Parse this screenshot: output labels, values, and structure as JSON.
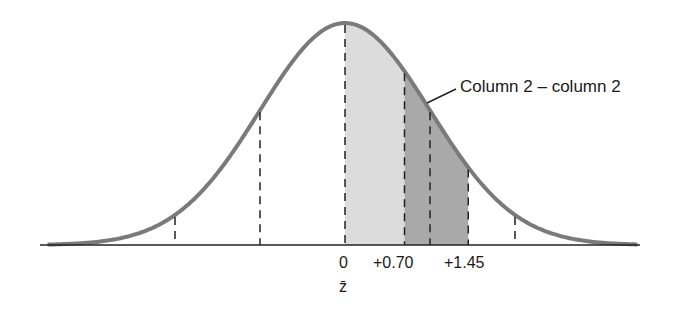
{
  "diagram": {
    "type": "normal-distribution-curve",
    "callout_label": "Column 2 – column 2",
    "axis_labels": {
      "zero": "0",
      "z_bar": "z̄",
      "plus_070": "+0.70",
      "plus_145": "+1.45"
    },
    "shaded_regions": [
      {
        "from": 0,
        "to": 0.7,
        "color": "#dcdcdc"
      },
      {
        "from": 0.7,
        "to": 1.45,
        "color": "#a9a9a9"
      }
    ],
    "reference_lines_sd": [
      -3,
      -2,
      -1,
      0,
      0.7,
      1.0,
      1.45,
      2,
      3
    ],
    "colors": {
      "curve": "#7a7a7a",
      "axis": "#222222",
      "dash": "#222222",
      "light_shade": "#dcdcdc",
      "dark_shade": "#a9a9a9"
    }
  }
}
